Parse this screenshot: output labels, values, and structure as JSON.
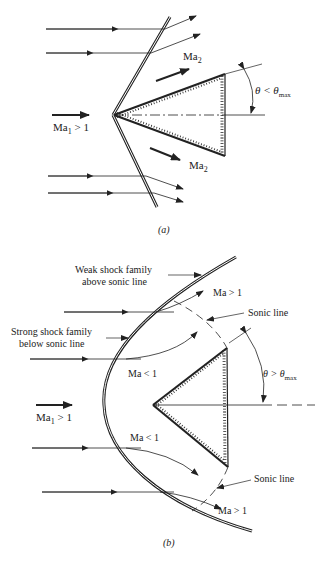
{
  "panel_a": {
    "caption": "(a)",
    "freestream_label": "Ma",
    "freestream_sub": "1",
    "freestream_rel": " > 1",
    "downstream_upper_label": "Ma",
    "downstream_upper_sub": "2",
    "downstream_lower_label": "Ma",
    "downstream_lower_sub": "2",
    "angle_label": "θ < θ",
    "angle_sub": "max"
  },
  "panel_b": {
    "caption": "(b)",
    "weak_shock_line1": "Weak shock family",
    "weak_shock_line2": "above sonic line",
    "strong_shock_line1": "Strong shock family",
    "strong_shock_line2": "below sonic line",
    "sonic_line_upper": "Sonic line",
    "sonic_line_lower": "Sonic line",
    "ma_gt1_upper": "Ma > 1",
    "ma_gt1_lower": "Ma > 1",
    "ma_lt1_upper": "Ma < 1",
    "ma_lt1_lower": "Ma < 1",
    "freestream_label": "Ma",
    "freestream_sub": "1",
    "freestream_rel": " > 1",
    "angle_label": "θ > θ",
    "angle_sub": "max"
  },
  "colors": {
    "ink": "#222222",
    "background": "#ffffff"
  }
}
